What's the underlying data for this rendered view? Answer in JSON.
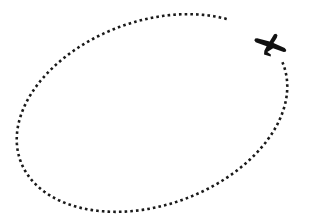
{
  "scene": {
    "title": "Airplane circling a dotted elliptical flight path",
    "width": 310,
    "height": 218,
    "background_color": "#ffffff"
  },
  "flight_path": {
    "label": "dotted elliptical flight path",
    "shape": "ellipse",
    "stroke_color": "#1a1a1a",
    "stroke_width": 2.6,
    "dash_pattern": "2.6 3.1",
    "dash_cap": "butt",
    "center_x": 152,
    "center_y": 113,
    "radius_x": 140,
    "radius_y": 92,
    "rotation_degrees": -20,
    "gap_start_degrees": -42,
    "gap_end_degrees": -2
  },
  "airplane": {
    "label": "airplane",
    "icon": "airplane-icon",
    "fill_color": "#111111",
    "center_x": 272,
    "center_y": 44,
    "heading_degrees": 38,
    "scale": 1.0
  },
  "chart_data": {
    "type": "scatter",
    "xlabel": "",
    "ylabel": "",
    "xlim": [
      0,
      310
    ],
    "ylim": [
      0,
      218
    ],
    "grid": false,
    "legend": "none",
    "series": [
      {
        "name": "flight path",
        "marker": "dotted ellipse",
        "color": "#1a1a1a",
        "center": [
          152,
          113
        ],
        "radii": [
          140,
          92
        ],
        "rotation_degrees": -20
      },
      {
        "name": "airplane marker",
        "marker": "airplane-icon",
        "color": "#111111",
        "x": [
          272
        ],
        "y": [
          44
        ],
        "heading_degrees": 38
      }
    ]
  }
}
